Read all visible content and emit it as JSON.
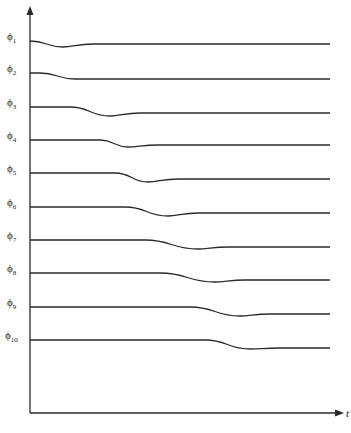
{
  "diagram": {
    "x_axis_label": "t",
    "caption": "",
    "axis": {
      "origin_x": 30,
      "origin_y": 413,
      "top_y": 8,
      "right_x": 345
    },
    "curves": [
      {
        "label": "ϕ",
        "sub": "1",
        "y": 41,
        "start": 30,
        "dip_start": 30,
        "dip_end": 63,
        "depth": 6,
        "recover": 3
      },
      {
        "label": "ϕ",
        "sub": "2",
        "y": 73,
        "start": 30,
        "dip_start": 40,
        "dip_end": 75,
        "depth": 6,
        "recover": 0
      },
      {
        "label": "ϕ",
        "sub": "3",
        "y": 107,
        "start": 30,
        "dip_start": 70,
        "dip_end": 110,
        "depth": 9,
        "recover": 3
      },
      {
        "label": "ϕ",
        "sub": "4",
        "y": 140,
        "start": 30,
        "dip_start": 100,
        "dip_end": 128,
        "depth": 7,
        "recover": 2
      },
      {
        "label": "ϕ",
        "sub": "5",
        "y": 173,
        "start": 30,
        "dip_start": 115,
        "dip_end": 148,
        "depth": 9,
        "recover": 3
      },
      {
        "label": "ϕ",
        "sub": "6",
        "y": 207,
        "start": 30,
        "dip_start": 125,
        "dip_end": 168,
        "depth": 9,
        "recover": 3
      },
      {
        "label": "ϕ",
        "sub": "7",
        "y": 240,
        "start": 30,
        "dip_start": 145,
        "dip_end": 198,
        "depth": 9,
        "recover": 2
      },
      {
        "label": "ϕ",
        "sub": "8",
        "y": 273,
        "start": 30,
        "dip_start": 160,
        "dip_end": 215,
        "depth": 9,
        "recover": 2
      },
      {
        "label": "ϕ",
        "sub": "9",
        "y": 307,
        "start": 30,
        "dip_start": 190,
        "dip_end": 240,
        "depth": 9,
        "recover": 2
      },
      {
        "label": "ϕ",
        "sub": "10",
        "y": 340,
        "start": 30,
        "dip_start": 205,
        "dip_end": 250,
        "depth": 9,
        "recover": 1
      }
    ],
    "line_end_x": 330,
    "stroke_color": "#2a2a2a"
  }
}
